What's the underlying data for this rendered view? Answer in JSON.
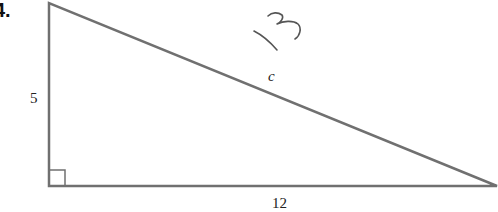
{
  "problem": {
    "number_label": "4."
  },
  "triangle": {
    "vertices": {
      "top": [
        49,
        3
      ],
      "right_angle": [
        49,
        186
      ],
      "right": [
        498,
        186
      ]
    },
    "stroke_color": "#707070",
    "right_angle_marker_size": 16,
    "labels": {
      "vertical_leg": "5",
      "horizontal_leg": "12",
      "hypotenuse": "c"
    }
  },
  "handwritten_answer": {
    "text": "13",
    "ink_color": "#555555"
  }
}
